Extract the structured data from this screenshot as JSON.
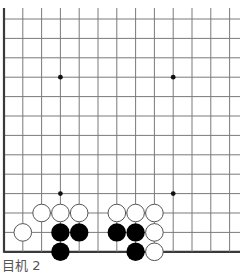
{
  "board": {
    "view": "partial-bottom-left",
    "columns": 13,
    "rows": 13,
    "open_edges": [
      "top",
      "right"
    ],
    "grid_origin_x": 4,
    "grid_origin_y": 19,
    "cell_w": 18.8,
    "cell_h": 19.4,
    "line_extend_right": 240,
    "line_extend_top": 8,
    "colors": {
      "grid": "#7a7a7a",
      "border": "#3a3a3a",
      "star": "#111111",
      "black_stone": "#000000",
      "white_stone": "#ffffff",
      "white_outline": "#555555"
    },
    "star_points": [
      {
        "col": 3,
        "row": 3
      },
      {
        "col": 9,
        "row": 3
      },
      {
        "col": 3,
        "row": 9
      },
      {
        "col": 9,
        "row": 9
      }
    ],
    "stones": [
      {
        "color": "white",
        "col": 2,
        "row": 10
      },
      {
        "color": "white",
        "col": 3,
        "row": 10
      },
      {
        "color": "white",
        "col": 4,
        "row": 10
      },
      {
        "color": "white",
        "col": 6,
        "row": 10
      },
      {
        "color": "white",
        "col": 7,
        "row": 10
      },
      {
        "color": "white",
        "col": 8,
        "row": 10
      },
      {
        "color": "white",
        "col": 1,
        "row": 11
      },
      {
        "color": "black",
        "col": 3,
        "row": 11
      },
      {
        "color": "black",
        "col": 4,
        "row": 11
      },
      {
        "color": "black",
        "col": 6,
        "row": 11
      },
      {
        "color": "black",
        "col": 7,
        "row": 11
      },
      {
        "color": "white",
        "col": 8,
        "row": 11
      },
      {
        "color": "black",
        "col": 3,
        "row": 12
      },
      {
        "color": "black",
        "col": 7,
        "row": 12
      },
      {
        "color": "white",
        "col": 8,
        "row": 12
      }
    ]
  },
  "caption": "目机 2"
}
